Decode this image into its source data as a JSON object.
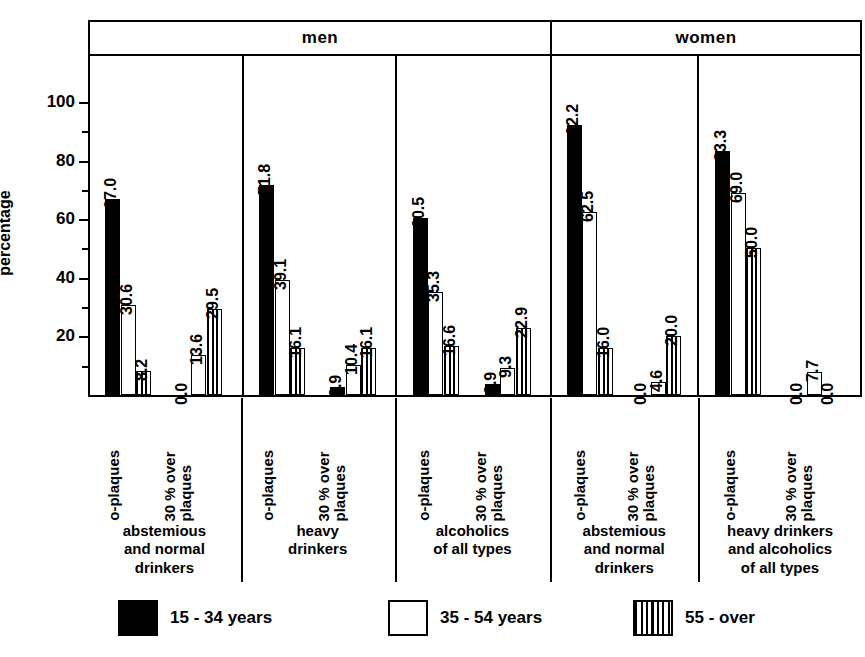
{
  "axis": {
    "ylabel": "percentage",
    "major_ticks": [
      20,
      40,
      60,
      80,
      100
    ],
    "minor_ticks": [
      10,
      30,
      50,
      70,
      90
    ],
    "ymax": 115
  },
  "header": {
    "cells": [
      {
        "label": "men",
        "span": 3
      },
      {
        "label": "women",
        "span": 2
      }
    ]
  },
  "legend": {
    "items": [
      {
        "label": "15 - 34 years",
        "swatch": "solid-black"
      },
      {
        "label": "35 - 54 years",
        "swatch": "open-white"
      },
      {
        "label": "55 - over",
        "swatch": "vertical-stripes"
      }
    ]
  },
  "chart_data": {
    "type": "bar",
    "title": "",
    "xlabel": "",
    "ylabel": "percentage",
    "ylim": [
      0,
      115
    ],
    "grid": false,
    "legend_position": "bottom",
    "series": [
      {
        "name": "15 - 34 years",
        "swatch": "solid-black"
      },
      {
        "name": "35 - 54 years",
        "swatch": "open-white"
      },
      {
        "name": "55 - over",
        "swatch": "vertical-stripes"
      }
    ],
    "panels": [
      {
        "sex": "men",
        "caption": "abstemious and normal drinkers",
        "caption_lines": [
          "abstemious",
          "and normal",
          "drinkers"
        ],
        "clusters": [
          {
            "label": "o-plaques",
            "label_lines": [
              "o-plaques"
            ],
            "values": [
              67.0,
              30.6,
              8.2
            ],
            "value_labels": [
              "67.0",
              "30.6",
              "8.2"
            ]
          },
          {
            "label": "30% over plaques",
            "label_lines": [
              "30 % over",
              "plaques"
            ],
            "values": [
              0.0,
              13.6,
              29.5
            ],
            "value_labels": [
              "0.0",
              "13.6",
              "29.5"
            ]
          }
        ]
      },
      {
        "sex": "men",
        "caption": "heavy drinkers",
        "caption_lines": [
          "heavy",
          "drinkers"
        ],
        "clusters": [
          {
            "label": "o-plaques",
            "label_lines": [
              "o-plaques"
            ],
            "values": [
              71.8,
              39.1,
              16.1
            ],
            "value_labels": [
              "71.8",
              "39.1",
              "16.1"
            ]
          },
          {
            "label": "30% over plaques",
            "label_lines": [
              "30 % over",
              "plaques"
            ],
            "values": [
              2.9,
              10.4,
              16.1
            ],
            "value_labels": [
              "2.9",
              "10.4",
              "16.1"
            ]
          }
        ]
      },
      {
        "sex": "men",
        "caption": "alcoholics of all types",
        "caption_lines": [
          "alcoholics",
          "of all types"
        ],
        "clusters": [
          {
            "label": "o-plaques",
            "label_lines": [
              "o-plaques"
            ],
            "values": [
              60.5,
              35.3,
              16.6
            ],
            "value_labels": [
              "60.5",
              "35.3",
              "16.6"
            ]
          },
          {
            "label": "30% over plaques",
            "label_lines": [
              "30 % over",
              "plaques"
            ],
            "values": [
              3.9,
              9.3,
              22.9
            ],
            "value_labels": [
              "3.9",
              "9.3",
              "22.9"
            ]
          }
        ]
      },
      {
        "sex": "women",
        "caption": "abstemious and normal drinkers",
        "caption_lines": [
          "abstemious",
          "and normal",
          "drinkers"
        ],
        "clusters": [
          {
            "label": "o-plaques",
            "label_lines": [
              "o-plaques"
            ],
            "values": [
              92.2,
              62.5,
              16.0
            ],
            "value_labels": [
              "92.2",
              "62.5",
              "16.0"
            ]
          },
          {
            "label": "30% over plaques",
            "label_lines": [
              "30 % over",
              "plaques"
            ],
            "values": [
              0.0,
              4.6,
              20.0
            ],
            "value_labels": [
              "0.0",
              "4.6",
              "20.0"
            ]
          }
        ]
      },
      {
        "sex": "women",
        "caption": "heavy drinkers and alcoholics of all types",
        "caption_lines": [
          "heavy drinkers",
          "and alcoholics",
          "of all types"
        ],
        "clusters": [
          {
            "label": "o-plaques",
            "label_lines": [
              "o-plaques"
            ],
            "values": [
              83.3,
              69.0,
              50.0
            ],
            "value_labels": [
              "83.3",
              "69.0",
              "50.0"
            ]
          },
          {
            "label": "30% over plaques",
            "label_lines": [
              "30 % over",
              "plaques"
            ],
            "values": [
              0.0,
              7.7,
              0.0
            ],
            "value_labels": [
              "0.0",
              "7.7",
              "0.0"
            ]
          }
        ]
      }
    ]
  }
}
